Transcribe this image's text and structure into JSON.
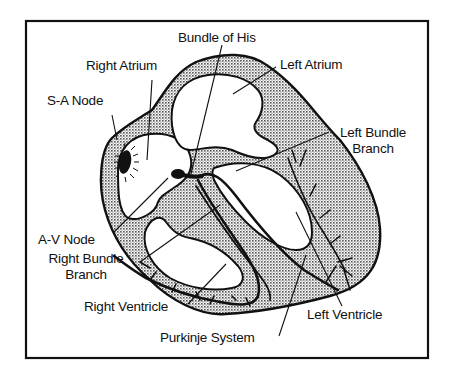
{
  "diagram": {
    "colors": {
      "ink": "#111111",
      "background": "#ffffff",
      "myocardium_fill": "#cfcfcf"
    },
    "labels": {
      "bundle_of_his": "Bundle of His",
      "right_atrium": "Right Atrium",
      "left_atrium": "Left Atrium",
      "sa_node": "S-A Node",
      "left_bundle_branch_line1": "Left Bundle",
      "left_bundle_branch_line2": "Branch",
      "av_node": "A-V Node",
      "right_bundle_branch_line1": "Right Bundle",
      "right_bundle_branch_line2": "Branch",
      "right_ventricle": "Right Ventricle",
      "purkinje_system": "Purkinje System",
      "left_ventricle": "Left Ventricle"
    }
  }
}
